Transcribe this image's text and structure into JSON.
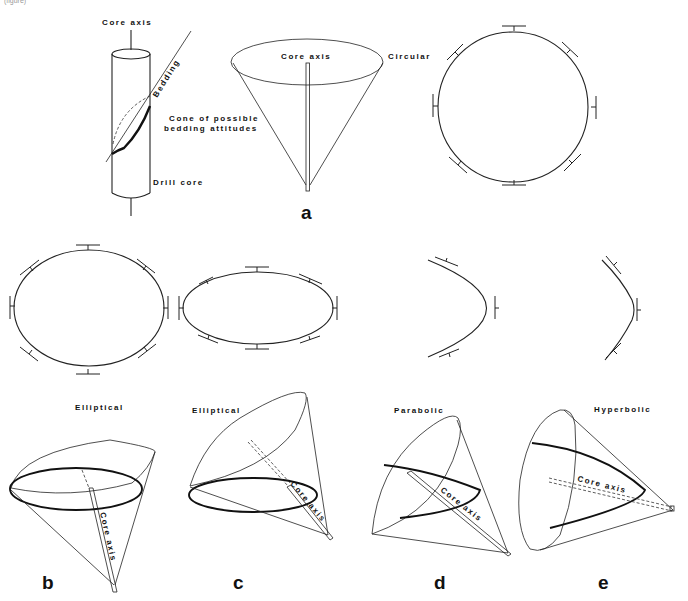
{
  "header_fragment": "(figure)",
  "panel_a": {
    "label": "a",
    "core_axis": "Core axis",
    "bedding": "Bedding",
    "cone_line1": "Cone of possible",
    "cone_line2": "bedding attitudes",
    "drill_core": "Drill core",
    "cone_core_axis": "Core axis",
    "section_type": "Circular"
  },
  "panel_b": {
    "label": "b",
    "section_type": "Elliptical",
    "core_axis": "Core axis"
  },
  "panel_c": {
    "label": "c",
    "section_type": "Elliptical",
    "core_axis": "Core axis"
  },
  "panel_d": {
    "label": "d",
    "section_type": "Parabolic",
    "core_axis": "Core axis"
  },
  "panel_e": {
    "label": "e",
    "section_type": "Hyperbolic",
    "core_axis": "Core axis"
  },
  "traces": {
    "circle": {
      "shape": "circle",
      "cx": 513,
      "cy": 107,
      "r": 75
    },
    "ellipse_b": {
      "shape": "ellipse",
      "cx": 89,
      "cy": 308,
      "rx": 75,
      "ry": 58
    },
    "ellipse_c": {
      "shape": "ellipse",
      "cx": 258,
      "cy": 308,
      "rx": 75,
      "ry": 36
    },
    "parabola": {
      "shape": "parabola"
    },
    "hyperbola": {
      "shape": "hyperbola"
    }
  }
}
